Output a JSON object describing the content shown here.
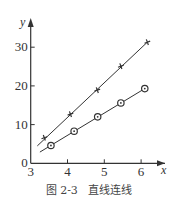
{
  "chart_data": {
    "type": "line",
    "title": "",
    "caption": "图 2-3   直线连线",
    "xlabel": "x",
    "ylabel": "y",
    "xlim": [
      3,
      6.6
    ],
    "ylim": [
      0,
      35
    ],
    "x_ticks": [
      3,
      4,
      5,
      6
    ],
    "y_ticks": [
      0,
      10,
      20,
      30
    ],
    "x_tick_labels": [
      "3",
      "4",
      "5",
      "6"
    ],
    "y_tick_labels": [
      "0",
      "10",
      "20",
      "30"
    ],
    "grid": false,
    "legend": null,
    "series": [
      {
        "name": "plus-markers",
        "marker": "plus",
        "points": [
          [
            3.37,
            6.6
          ],
          [
            4.08,
            12.7
          ],
          [
            4.81,
            18.9
          ],
          [
            5.45,
            25.1
          ],
          [
            6.17,
            31.3
          ]
        ],
        "fit_line": [
          [
            3.18,
            4.5
          ],
          [
            6.17,
            31.3
          ]
        ]
      },
      {
        "name": "circle-markers",
        "marker": "circle-dot",
        "points": [
          [
            3.55,
            4.6
          ],
          [
            4.18,
            8.3
          ],
          [
            4.82,
            12.0
          ],
          [
            5.45,
            15.6
          ],
          [
            6.1,
            19.3
          ]
        ],
        "fit_line": [
          [
            3.25,
            2.9
          ],
          [
            6.1,
            19.3
          ]
        ]
      }
    ]
  },
  "colors": {
    "ink": "#333333",
    "background": "#ffffff"
  }
}
